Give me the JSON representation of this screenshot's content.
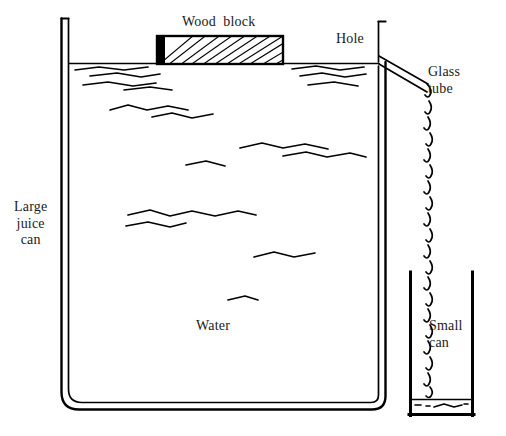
{
  "diagram": {
    "type": "line-drawing",
    "ink_color": "#000000",
    "background_color": "#ffffff",
    "labels": {
      "wood_block": "Wood  block",
      "hole": "Hole",
      "glass_tube": "Glass\ntube",
      "large_juice_can": "Large\njuice\ncan",
      "water": "Water",
      "small_can": "Small\ncan"
    },
    "parts": {
      "large_can": {
        "name": "Large juice can",
        "left_wall_x": 61,
        "right_wall_x": 385,
        "top_y": 18,
        "bottom_y": 410,
        "wall_style": "double-line rounded-bottom"
      },
      "wood_block": {
        "name": "Wood block floating on water",
        "x": 157,
        "y": 36,
        "width": 126,
        "height": 28,
        "fill": "diagonal wood-grain hatching",
        "end_cap": "solid black left edge"
      },
      "water_surface_y": 64,
      "hole": {
        "name": "Hole in can wall",
        "x": 385,
        "y": 62
      },
      "glass_tube": {
        "name": "Glass tube",
        "from_x": 385,
        "from_y": 62,
        "to_x": 430,
        "to_y": 88,
        "nozzle": "downturned spout"
      },
      "water_stream": {
        "name": "Falling water droplets",
        "x": 429,
        "from_y": 96,
        "to_y": 398,
        "droplet_count": 19
      },
      "small_can": {
        "name": "Small can",
        "left_wall_x": 409,
        "right_wall_x": 473,
        "top_y": 272,
        "bottom_y": 416,
        "water_level_y": 400
      }
    }
  }
}
